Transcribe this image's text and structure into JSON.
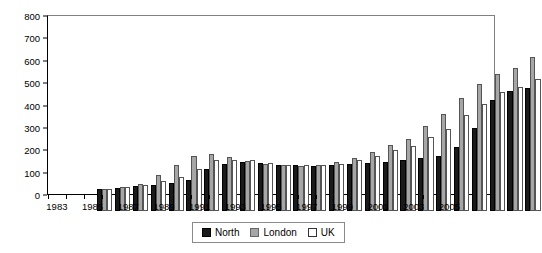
{
  "chart_data": {
    "type": "bar",
    "title": "",
    "xlabel": "",
    "ylabel": "",
    "ylim": [
      0,
      800
    ],
    "yticks": [
      0,
      100,
      200,
      300,
      400,
      500,
      600,
      700,
      800
    ],
    "grid": false,
    "legend_position": "bottom",
    "categories": [
      "1983",
      "1984",
      "1985",
      "1986",
      "1987",
      "1988",
      "1989",
      "1990",
      "1991",
      "1992",
      "1993",
      "1994",
      "1995",
      "1996",
      "1997",
      "1998",
      "1999",
      "2000",
      "2001",
      "2002",
      "2003",
      "2004",
      "2005",
      "2006",
      "2007"
    ],
    "tick_labels": [
      "1983",
      "",
      "1985",
      "",
      "1987",
      "",
      "1989",
      "",
      "1991",
      "",
      "1993",
      "",
      "1995",
      "",
      "1997",
      "",
      "1999",
      "",
      "2001",
      "",
      "2003",
      "",
      "2005",
      "",
      ""
    ],
    "series": [
      {
        "name": "North",
        "color": "#1a1a1a",
        "values": [
          100,
          103,
          110,
          117,
          124,
          140,
          186,
          211,
          219,
          214,
          206,
          204,
          201,
          207,
          212,
          215,
          220,
          228,
          236,
          247,
          285,
          372,
          495,
          535,
          548
        ]
      },
      {
        "name": "London",
        "color": "#a6a6a6",
        "values": [
          100,
          107,
          122,
          161,
          205,
          247,
          253,
          240,
          225,
          209,
          205,
          203,
          205,
          217,
          238,
          262,
          297,
          323,
          379,
          432,
          505,
          566,
          612,
          640,
          690
        ]
      },
      {
        "name": "UK",
        "color": "#ffffff",
        "values": [
          100,
          106,
          116,
          133,
          152,
          188,
          227,
          229,
          227,
          213,
          206,
          204,
          205,
          212,
          226,
          248,
          271,
          289,
          331,
          366,
          431,
          480,
          533,
          556,
          588
        ]
      }
    ]
  },
  "legend": {
    "items": [
      {
        "label": "North",
        "key": "north"
      },
      {
        "label": "London",
        "key": "london"
      },
      {
        "label": "UK",
        "key": "uk"
      }
    ]
  }
}
